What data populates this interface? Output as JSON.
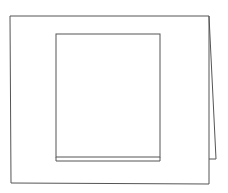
{
  "drawing": {
    "description": "Line sketch of a folded card with a rectangular window",
    "stroke_color": "#555555",
    "background_color": "#ffffff",
    "outer_frame": {
      "points": [
        [
          10,
          16
        ],
        [
          209,
          16
        ],
        [
          209,
          184
        ],
        [
          11,
          183
        ]
      ]
    },
    "fold_flap": {
      "points": [
        [
          209,
          16
        ],
        [
          216,
          159
        ],
        [
          209,
          159
        ]
      ]
    },
    "inner_window": {
      "x": 56,
      "y": 34,
      "width": 104,
      "height": 123
    },
    "inner_bottom_edge": {
      "points": [
        [
          56,
          161
        ],
        [
          160,
          161
        ]
      ]
    }
  }
}
